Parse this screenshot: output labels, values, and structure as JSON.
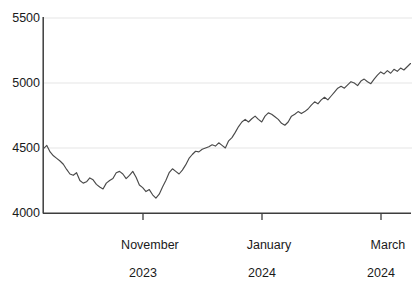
{
  "chart_data": {
    "type": "line",
    "title": "",
    "subtitle": "",
    "xlabel": "",
    "ylabel": "",
    "grid": true,
    "gridlines_y": [
      4500,
      5000,
      5500
    ],
    "legend": null,
    "legend_position": "none",
    "series_color": "#4a4a4a",
    "xlim_labels": [
      "November 2023",
      "January 2024",
      "March 2024"
    ],
    "ylim": [
      4000,
      5500
    ],
    "yticks": [
      4000,
      4500,
      5000,
      5500
    ],
    "ytick_labels": [
      "4000",
      "4500",
      "5000",
      "5500"
    ],
    "xticks": [
      "November 2023",
      "January 2024",
      "March 2024"
    ],
    "xtick_labels": [
      {
        "month": "November",
        "year": "2023"
      },
      {
        "month": "January",
        "year": "2024"
      },
      {
        "month": "March",
        "year": "2024"
      }
    ],
    "series": [
      {
        "name": "Index level",
        "values": [
          4495,
          4520,
          4470,
          4440,
          4420,
          4400,
          4375,
          4335,
          4300,
          4290,
          4310,
          4250,
          4230,
          4240,
          4270,
          4255,
          4220,
          4200,
          4185,
          4230,
          4250,
          4265,
          4310,
          4320,
          4300,
          4265,
          4290,
          4320,
          4275,
          4215,
          4195,
          4165,
          4180,
          4140,
          4115,
          4145,
          4200,
          4250,
          4310,
          4340,
          4320,
          4300,
          4330,
          4370,
          4420,
          4450,
          4475,
          4470,
          4490,
          4500,
          4510,
          4525,
          4515,
          4540,
          4520,
          4500,
          4555,
          4580,
          4620,
          4665,
          4700,
          4720,
          4700,
          4725,
          4745,
          4720,
          4700,
          4745,
          4770,
          4760,
          4740,
          4720,
          4690,
          4675,
          4700,
          4745,
          4760,
          4780,
          4765,
          4780,
          4800,
          4830,
          4855,
          4840,
          4870,
          4890,
          4870,
          4900,
          4930,
          4960,
          4975,
          4960,
          4985,
          5010,
          5000,
          4980,
          5015,
          5030,
          5010,
          4995,
          5030,
          5060,
          5085,
          5070,
          5095,
          5075,
          5105,
          5090,
          5115,
          5100,
          5125,
          5150
        ]
      }
    ],
    "x_axis_fraction_ticks": [
      0.27,
      0.595,
      0.92
    ],
    "annotations": []
  }
}
